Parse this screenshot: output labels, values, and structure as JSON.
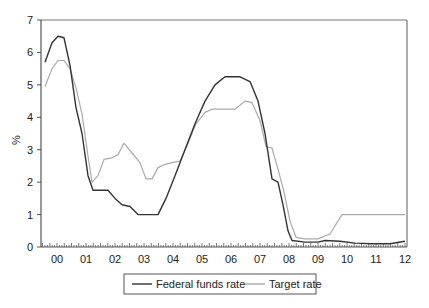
{
  "chart_data": {
    "type": "line",
    "title": "",
    "xlabel": "",
    "ylabel": "%",
    "ylim": [
      0,
      7
    ],
    "yticks": [
      0,
      1,
      2,
      3,
      4,
      5,
      6,
      7
    ],
    "xtick_labels": [
      "00",
      "01",
      "02",
      "03",
      "04",
      "05",
      "06",
      "07",
      "08",
      "09",
      "10",
      "11",
      "12"
    ],
    "grid": false,
    "legend_position": "bottom",
    "series": [
      {
        "name": "Federal funds rate",
        "color": "#333333",
        "x_year": [
          1999.6,
          1999.85,
          2000.05,
          2000.25,
          2000.45,
          2000.65,
          2000.85,
          2001.05,
          2001.25,
          2001.5,
          2001.75,
          2002.0,
          2002.25,
          2002.5,
          2002.8,
          2003.15,
          2003.5,
          2003.8,
          2004.1,
          2004.45,
          2004.8,
          2005.1,
          2005.45,
          2005.8,
          2006.3,
          2006.65,
          2006.95,
          2007.2,
          2007.45,
          2007.65,
          2007.85,
          2008.0,
          2008.15,
          2008.6,
          2009.05,
          2009.3,
          2009.8,
          2010.3,
          2010.9,
          2011.5,
          2012.0
        ],
        "values": [
          5.7,
          6.3,
          6.5,
          6.45,
          5.6,
          4.3,
          3.5,
          2.2,
          1.75,
          1.75,
          1.75,
          1.5,
          1.3,
          1.25,
          1.0,
          1.0,
          1.0,
          1.5,
          2.2,
          3.0,
          3.8,
          4.5,
          5.0,
          5.25,
          5.25,
          5.1,
          4.5,
          3.5,
          2.1,
          2.0,
          1.3,
          0.5,
          0.2,
          0.15,
          0.15,
          0.2,
          0.18,
          0.12,
          0.1,
          0.1,
          0.18
        ]
      },
      {
        "name": "Target rate",
        "color": "#aaaaaa",
        "x_year": [
          1999.6,
          1999.85,
          2000.05,
          2000.25,
          2000.45,
          2000.65,
          2000.85,
          2001.05,
          2001.2,
          2001.4,
          2001.6,
          2001.9,
          2002.1,
          2002.3,
          2002.6,
          2002.85,
          2003.05,
          2003.25,
          2003.5,
          2003.75,
          2004.0,
          2004.25,
          2004.55,
          2004.8,
          2005.1,
          2005.35,
          2005.7,
          2006.15,
          2006.5,
          2006.75,
          2007.0,
          2007.2,
          2007.45,
          2007.65,
          2007.85,
          2008.05,
          2008.25,
          2008.6,
          2009.05,
          2009.45,
          2009.65,
          2009.85,
          2010.45,
          2011.3,
          2012.0
        ],
        "values": [
          4.95,
          5.5,
          5.75,
          5.75,
          5.5,
          4.9,
          4.1,
          2.8,
          2.0,
          2.2,
          2.7,
          2.75,
          2.85,
          3.2,
          2.9,
          2.6,
          2.1,
          2.1,
          2.45,
          2.55,
          2.6,
          2.65,
          3.2,
          3.8,
          4.15,
          4.25,
          4.25,
          4.25,
          4.5,
          4.45,
          3.9,
          3.1,
          3.05,
          2.4,
          1.7,
          0.8,
          0.3,
          0.25,
          0.25,
          0.4,
          0.7,
          1.0,
          1.0,
          1.0,
          1.0
        ]
      }
    ],
    "pixel_series": [
      {
        "name": "Federal funds rate",
        "points": [
          [
            45,
            5.7
          ],
          [
            52,
            6.3
          ],
          [
            58,
            6.5
          ],
          [
            64,
            6.45
          ],
          [
            70,
            5.6
          ],
          [
            76,
            4.3
          ],
          [
            82,
            3.5
          ],
          [
            88,
            2.2
          ],
          [
            93,
            1.75
          ],
          [
            100,
            1.75
          ],
          [
            108,
            1.75
          ],
          [
            115,
            1.5
          ],
          [
            122,
            1.3
          ],
          [
            130,
            1.25
          ],
          [
            138,
            1.0
          ],
          [
            148,
            1.0
          ],
          [
            158,
            1.0
          ],
          [
            166,
            1.5
          ],
          [
            175,
            2.2
          ],
          [
            185,
            3.0
          ],
          [
            195,
            3.8
          ],
          [
            205,
            4.5
          ],
          [
            215,
            5.0
          ],
          [
            225,
            5.25
          ],
          [
            240,
            5.25
          ],
          [
            250,
            5.1
          ],
          [
            258,
            4.5
          ],
          [
            265,
            3.5
          ],
          [
            272,
            2.1
          ],
          [
            278,
            2.0
          ],
          [
            283,
            1.3
          ],
          [
            288,
            0.5
          ],
          [
            292,
            0.2
          ],
          [
            305,
            0.15
          ],
          [
            318,
            0.15
          ],
          [
            325,
            0.2
          ],
          [
            340,
            0.18
          ],
          [
            355,
            0.12
          ],
          [
            372,
            0.1
          ],
          [
            390,
            0.1
          ],
          [
            405,
            0.18
          ]
        ]
      },
      {
        "name": "Target rate",
        "points": [
          [
            45,
            4.95
          ],
          [
            52,
            5.5
          ],
          [
            58,
            5.75
          ],
          [
            64,
            5.75
          ],
          [
            70,
            5.5
          ],
          [
            76,
            4.9
          ],
          [
            82,
            4.1
          ],
          [
            88,
            2.8
          ],
          [
            92,
            2.0
          ],
          [
            98,
            2.2
          ],
          [
            104,
            2.7
          ],
          [
            112,
            2.75
          ],
          [
            118,
            2.85
          ],
          [
            124,
            3.2
          ],
          [
            132,
            2.9
          ],
          [
            140,
            2.6
          ],
          [
            146,
            2.1
          ],
          [
            152,
            2.1
          ],
          [
            158,
            2.45
          ],
          [
            165,
            2.55
          ],
          [
            172,
            2.6
          ],
          [
            180,
            2.65
          ],
          [
            188,
            3.2
          ],
          [
            196,
            3.8
          ],
          [
            205,
            4.15
          ],
          [
            212,
            4.25
          ],
          [
            222,
            4.25
          ],
          [
            235,
            4.25
          ],
          [
            245,
            4.5
          ],
          [
            252,
            4.45
          ],
          [
            260,
            3.9
          ],
          [
            266,
            3.1
          ],
          [
            272,
            3.05
          ],
          [
            278,
            2.4
          ],
          [
            284,
            1.7
          ],
          [
            290,
            0.8
          ],
          [
            296,
            0.3
          ],
          [
            305,
            0.25
          ],
          [
            318,
            0.25
          ],
          [
            330,
            0.4
          ],
          [
            336,
            0.7
          ],
          [
            342,
            1.0
          ],
          [
            360,
            1.0
          ],
          [
            385,
            1.0
          ],
          [
            405,
            1.0
          ]
        ]
      }
    ]
  },
  "legend": {
    "items": [
      {
        "label": "Federal funds rate",
        "color": "#333333"
      },
      {
        "label": "Target rate",
        "color": "#aaaaaa"
      }
    ]
  },
  "axes": {
    "ylabel": "%"
  }
}
